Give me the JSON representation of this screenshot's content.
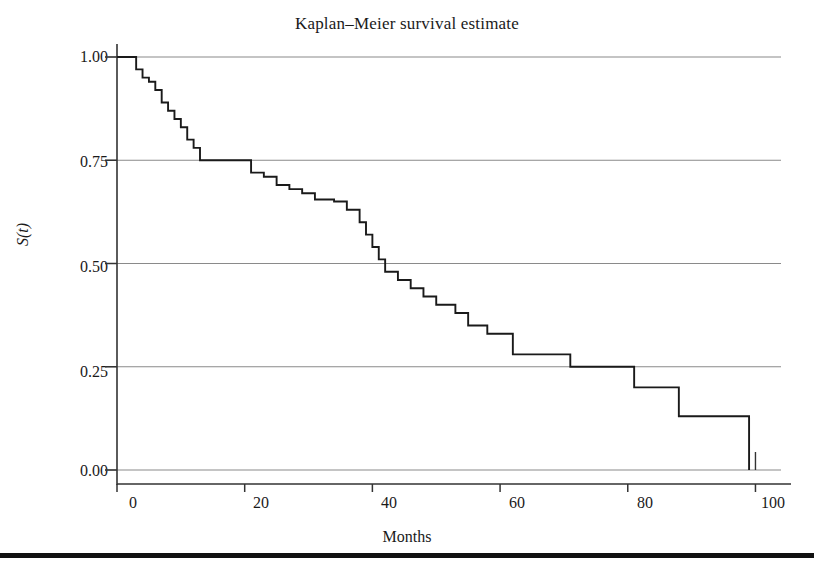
{
  "figure": {
    "title": "Kaplan–Meier survival estimate",
    "background_color": "#ffffff",
    "line_color": "#1a1a1a",
    "grid_color": "#8a8a8a",
    "axis_color": "#333333",
    "page_rule_color": "#111111"
  },
  "axes": {
    "x": {
      "label": "Months",
      "ticks": [
        0,
        20,
        40,
        60,
        80,
        100
      ],
      "tick_labels": [
        "0",
        "20",
        "40",
        "60",
        "80",
        "100"
      ],
      "range": [
        0,
        104
      ]
    },
    "y": {
      "label": "S(t)",
      "ticks": [
        0.0,
        0.25,
        0.5,
        0.75,
        1.0
      ],
      "tick_labels": [
        "0.00",
        "0.25",
        "0.50",
        "0.75",
        "1.00"
      ],
      "range": [
        0.0,
        1.0
      ]
    }
  },
  "chart_data": {
    "type": "line",
    "subtype": "step-post",
    "title": "Kaplan–Meier survival estimate",
    "xlabel": "Months",
    "ylabel": "S(t)",
    "xlim": [
      0,
      104
    ],
    "ylim": [
      0.0,
      1.0
    ],
    "grid": true,
    "grid_axis": "y",
    "legend": false,
    "series": [
      {
        "name": "Kaplan-Meier survival estimate",
        "x": [
          0,
          2,
          3,
          4,
          5,
          6,
          7,
          8,
          9,
          10,
          11,
          12,
          13,
          20,
          21,
          23,
          25,
          27,
          29,
          31,
          34,
          36,
          38,
          39,
          40,
          41,
          42,
          44,
          46,
          48,
          50,
          53,
          55,
          58,
          62,
          71,
          81,
          88,
          99,
          99
        ],
        "y": [
          1.0,
          1.0,
          0.97,
          0.95,
          0.94,
          0.92,
          0.89,
          0.87,
          0.85,
          0.83,
          0.8,
          0.78,
          0.75,
          0.75,
          0.72,
          0.71,
          0.69,
          0.68,
          0.67,
          0.655,
          0.65,
          0.63,
          0.6,
          0.57,
          0.54,
          0.51,
          0.48,
          0.46,
          0.44,
          0.42,
          0.4,
          0.38,
          0.35,
          0.33,
          0.28,
          0.25,
          0.2,
          0.13,
          0.13,
          0.0
        ]
      }
    ]
  }
}
